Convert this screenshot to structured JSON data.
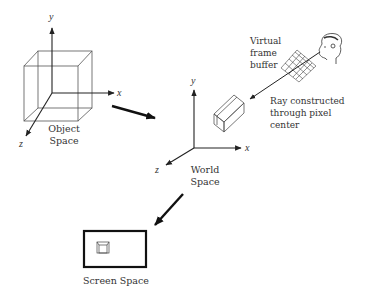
{
  "object_space": {
    "label_line1": "Object",
    "label_line2": "Space",
    "axes": {
      "x": "x",
      "y": "y",
      "z": "z"
    }
  },
  "world_space": {
    "label_line1": "World",
    "label_line2": "Space",
    "axes": {
      "x": "x",
      "y": "y",
      "z": "z"
    }
  },
  "frame_buffer": {
    "label_line1": "Virtual",
    "label_line2": "frame",
    "label_line3": "buffer"
  },
  "ray": {
    "label_line1": "Ray constructed",
    "label_line2": "through pixel",
    "label_line3": "center"
  },
  "screen_space": {
    "label": "Screen Space"
  },
  "colors": {
    "line": "#333333",
    "background": "#ffffff"
  }
}
